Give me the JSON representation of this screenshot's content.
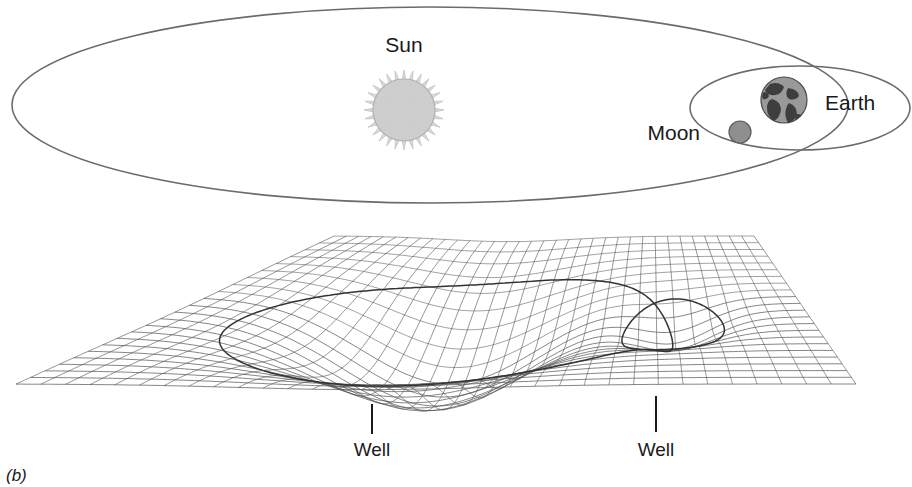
{
  "figure": {
    "caption": "(b)"
  },
  "colors": {
    "background": "#ffffff",
    "orbit_stroke": "#6b6b6b",
    "mesh_stroke": "#555555",
    "surface_orbit_stroke": "#333333",
    "sun_fill": "#cfcfcf",
    "sun_corona": "#d9d9d9",
    "earth_fill": "#9a9a9a",
    "earth_land": "#3d3d3d",
    "moon_fill": "#8f8f8f",
    "text": "#1a1a1a",
    "leader_line": "#1a1a1a"
  },
  "top_panel": {
    "bodies": [
      {
        "id": "sun",
        "label": "Sun",
        "cx": 404,
        "cy": 110,
        "r": 32,
        "label_x": 404,
        "label_y": 52
      },
      {
        "id": "earth",
        "label": "Earth",
        "cx": 784,
        "cy": 100,
        "r": 23,
        "label_x": 825,
        "label_y": 110
      },
      {
        "id": "moon",
        "label": "Moon",
        "cx": 740,
        "cy": 132,
        "r": 11,
        "label_x": 700,
        "label_y": 140
      }
    ],
    "orbits": [
      {
        "id": "earth-orbit-around-sun",
        "cx": 430,
        "cy": 105,
        "rx": 418,
        "ry": 98
      },
      {
        "id": "moon-orbit-around-earth",
        "cx": 800,
        "cy": 108,
        "rx": 110,
        "ry": 42
      }
    ]
  },
  "bottom_panel": {
    "wells": [
      {
        "id": "sun-well",
        "label": "Well",
        "label_x": 372,
        "label_y": 456,
        "leader_x": 372,
        "leader_y1": 404,
        "leader_y2": 434,
        "depth": "deep"
      },
      {
        "id": "earth-well",
        "label": "Well",
        "label_x": 656,
        "label_y": 456,
        "leader_x": 656,
        "leader_y1": 396,
        "leader_y2": 432,
        "depth": "shallow"
      }
    ],
    "mesh": {
      "description": "perspective wireframe of curved spacetime",
      "rows": 22,
      "cols": 34
    },
    "surface_orbits": [
      {
        "id": "sun-well-orbit-trace"
      },
      {
        "id": "earth-well-orbit-trace"
      }
    ]
  }
}
